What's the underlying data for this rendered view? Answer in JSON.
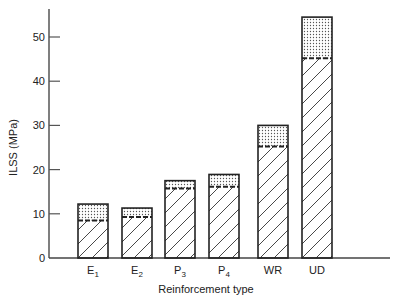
{
  "chart_data": {
    "type": "bar",
    "stacked": true,
    "title": "",
    "xlabel": "Reinforcement type",
    "ylabel": "ILSS (MPa)",
    "ylim": [
      0,
      55
    ],
    "yticks": [
      0,
      10,
      20,
      30,
      40,
      50
    ],
    "grid": false,
    "legend": null,
    "categories": [
      "E1",
      "E2",
      "P3",
      "P4",
      "WR",
      "UD"
    ],
    "category_labels": [
      {
        "base": "E",
        "sub": "1"
      },
      {
        "base": "E",
        "sub": "2"
      },
      {
        "base": "P",
        "sub": "3"
      },
      {
        "base": "P",
        "sub": "4"
      },
      {
        "base": "WR",
        "sub": ""
      },
      {
        "base": "UD",
        "sub": ""
      }
    ],
    "series": [
      {
        "name": "lower (hatched) value",
        "pattern": "diagonal-hatch",
        "values": [
          8.5,
          9.3,
          15.7,
          16.1,
          25.2,
          45.2
        ]
      },
      {
        "name": "upper (dotted) total",
        "pattern": "stipple",
        "values": [
          12.2,
          11.3,
          17.5,
          18.9,
          30.0,
          54.5
        ]
      }
    ],
    "annotations": [
      "Dashed line marks boundary between hatched lower value and dotted upper portion"
    ]
  }
}
